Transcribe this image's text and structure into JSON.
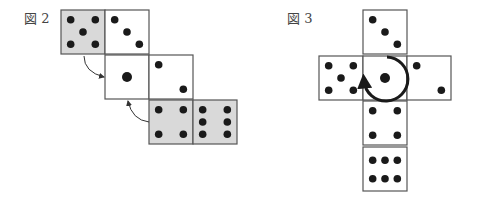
{
  "figures": [
    {
      "label": "図 2",
      "label_pos": [
        24,
        8
      ],
      "faces": [
        {
          "x": 61,
          "y": 10,
          "value": 5,
          "shaded": true
        },
        {
          "x": 105,
          "y": 10,
          "value": 3,
          "shaded": false
        },
        {
          "x": 105,
          "y": 55,
          "value": 1,
          "shaded": false
        },
        {
          "x": 149,
          "y": 55,
          "value": 2,
          "shaded": false
        },
        {
          "x": 149,
          "y": 100,
          "value": 4,
          "shaded": true
        },
        {
          "x": 193,
          "y": 100,
          "value": 6,
          "shaded": true
        }
      ],
      "arrows": [
        {
          "from": [
            84,
            56
          ],
          "to": [
            104,
            77
          ],
          "curve": [
            84,
            72
          ]
        },
        {
          "from": [
            149,
            122
          ],
          "to": [
            128,
            101
          ],
          "curve": [
            132,
            120
          ]
        }
      ]
    },
    {
      "label": "図 3",
      "label_pos": [
        287,
        8
      ],
      "faces": [
        {
          "x": 363,
          "y": 10,
          "value": 3,
          "shaded": false
        },
        {
          "x": 319,
          "y": 56,
          "value": 5,
          "shaded": false
        },
        {
          "x": 363,
          "y": 56,
          "value": 1,
          "shaded": false
        },
        {
          "x": 407,
          "y": 56,
          "value": 2,
          "shaded": false
        },
        {
          "x": 363,
          "y": 101,
          "value": 4,
          "shaded": false
        },
        {
          "x": 363,
          "y": 147,
          "value": 6,
          "shaded": false,
          "horizontal": true
        }
      ],
      "rotation_arrow": {
        "cx": 385,
        "cy": 79,
        "r": 22
      }
    }
  ],
  "colors": {
    "shade": "#d9d9d9",
    "border": "#555555",
    "pip": "#1a1a1a"
  },
  "face_size": 44
}
